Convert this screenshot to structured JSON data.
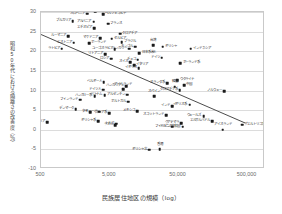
{
  "chart_data": {
    "type": "scatter",
    "title": "",
    "xlabel": "民族居住地区の規模（log）",
    "ylabel": "昭和50年代における隔離さの改善度（％）",
    "xscale": "log",
    "xlim": [
      500,
      900000
    ],
    "ylim": [
      -10,
      30
    ],
    "xticks": [
      500,
      5000,
      50000,
      500000
    ],
    "xticklabels": [
      "500",
      "5,000",
      "50,000",
      "500,000"
    ],
    "yticks": [
      -10,
      -5,
      0,
      5,
      10,
      15,
      20,
      25,
      30
    ],
    "yticklabels": [
      "-10",
      "-5",
      "0",
      "5",
      "10",
      "15",
      "20",
      "25",
      "30"
    ],
    "grid": "horizontal",
    "legend": "none",
    "trendline": {
      "label": "回帰直線",
      "x0": 500,
      "y0": 24.2,
      "x1": 500000,
      "y1": 1.3,
      "color": "#4a4a4a"
    },
    "points": [
      {
        "label": "スロベニア",
        "x": 2350,
        "y": 29.6,
        "pos": "left"
      },
      {
        "label": "ボスニア",
        "x": 3050,
        "y": 30.2,
        "pos": "right"
      },
      {
        "label": "ヘルツェゴビナ",
        "x": 4000,
        "y": 29.4,
        "pos": "right"
      },
      {
        "label": "ブルガリア",
        "x": 1450,
        "y": 27.6,
        "pos": "left"
      },
      {
        "label": "アルバニア",
        "x": 2900,
        "y": 27.5,
        "pos": "left"
      },
      {
        "label": "フランス",
        "x": 4750,
        "y": 27.0,
        "pos": "right"
      },
      {
        "label": "エチオピア",
        "x": 2950,
        "y": 25.9,
        "pos": "left"
      },
      {
        "label": "クロアチア",
        "x": 7100,
        "y": 24.5,
        "pos": "right"
      },
      {
        "label": "ルーマニア",
        "x": 1250,
        "y": 23.9,
        "pos": "left"
      },
      {
        "label": "マケドニア",
        "x": 3600,
        "y": 23.3,
        "pos": "left"
      },
      {
        "label": "セルビア",
        "x": 5350,
        "y": 23.2,
        "pos": "right"
      },
      {
        "label": "エストニア",
        "x": 1500,
        "y": 22.2,
        "pos": "left"
      },
      {
        "label": "ポーランド",
        "x": 2500,
        "y": 22.0,
        "pos": "right"
      },
      {
        "label": "ブラジル",
        "x": 7400,
        "y": 22.3,
        "pos": "right"
      },
      {
        "label": "モンゴル",
        "x": 11800,
        "y": 21.2,
        "pos": "left"
      },
      {
        "label": "台湾",
        "x": 21500,
        "y": 21.6,
        "pos": "center"
      },
      {
        "label": "ギリシャ",
        "x": 29500,
        "y": 21.2,
        "pos": "right"
      },
      {
        "label": "ラトビア",
        "x": 1000,
        "y": 20.6,
        "pos": "left"
      },
      {
        "label": "ユーゴスラビア",
        "x": 5900,
        "y": 20.5,
        "pos": "left"
      },
      {
        "label": "ハンガリー",
        "x": 9600,
        "y": 20.7,
        "pos": "left"
      },
      {
        "label": "インドネシア",
        "x": 75000,
        "y": 20.7,
        "pos": "right"
      },
      {
        "label": "リトアニア",
        "x": 4300,
        "y": 19.2,
        "pos": "left"
      },
      {
        "label": "日本系米人",
        "x": 13500,
        "y": 19.5,
        "pos": "right"
      },
      {
        "label": "ロシア",
        "x": 5200,
        "y": 18.1,
        "pos": "left"
      },
      {
        "label": "ドイツ",
        "x": 28500,
        "y": 18.4,
        "pos": "left"
      },
      {
        "label": "チェコ",
        "x": 12800,
        "y": 17.8,
        "pos": "left"
      },
      {
        "label": "スイス",
        "x": 9800,
        "y": 17.2,
        "pos": "left"
      },
      {
        "label": "ポーランド系",
        "x": 53000,
        "y": 16.9,
        "pos": "right"
      },
      {
        "label": "イタリア",
        "x": 11200,
        "y": 16.5,
        "pos": "right"
      },
      {
        "label": "イギリス",
        "x": 13200,
        "y": 15.7,
        "pos": "left"
      },
      {
        "label": "ウクライナ",
        "x": 48000,
        "y": 12.6,
        "pos": "right"
      },
      {
        "label": "ベルギー人",
        "x": 4100,
        "y": 12.1,
        "pos": "left"
      },
      {
        "label": "オランダ系",
        "x": 34000,
        "y": 11.9,
        "pos": "left"
      },
      {
        "label": "ハンガリアン",
        "x": 8700,
        "y": 11.1,
        "pos": "left"
      },
      {
        "label": "中国",
        "x": 60000,
        "y": 11.3,
        "pos": "right"
      },
      {
        "label": "韓国",
        "x": 44000,
        "y": 11.0,
        "pos": "center"
      },
      {
        "label": "ドイツ人",
        "x": 4000,
        "y": 10.2,
        "pos": "left"
      },
      {
        "label": "アイルランド",
        "x": 7800,
        "y": 10.4,
        "pos": "center"
      },
      {
        "label": "クロアチア系",
        "x": 52000,
        "y": 10.1,
        "pos": "left"
      },
      {
        "label": "ノルウェー",
        "x": 230000,
        "y": 9.8,
        "pos": "left"
      },
      {
        "label": "アルゼンチン",
        "x": 9000,
        "y": 8.9,
        "pos": "left"
      },
      {
        "label": "ベトナム",
        "x": 4200,
        "y": 8.8,
        "pos": "left"
      },
      {
        "label": "ハンガリー系",
        "x": 3000,
        "y": 8.5,
        "pos": "left"
      },
      {
        "label": "スペイン",
        "x": 22000,
        "y": 8.5,
        "pos": "center"
      },
      {
        "label": "フィンランド",
        "x": 1850,
        "y": 7.7,
        "pos": "left"
      },
      {
        "label": "ポルトガル",
        "x": 9200,
        "y": 7.1,
        "pos": "left"
      },
      {
        "label": "インド",
        "x": 40000,
        "y": 6.0,
        "pos": "left"
      },
      {
        "label": "イギリス系",
        "x": 72000,
        "y": 6.4,
        "pos": "left"
      },
      {
        "label": "デンマーク",
        "x": 1600,
        "y": 5.3,
        "pos": "left"
      },
      {
        "label": "メキシコ",
        "x": 12500,
        "y": 4.7,
        "pos": "left"
      },
      {
        "label": "キューバ",
        "x": 3500,
        "y": 4.6,
        "pos": "left"
      },
      {
        "label": "スコットランド",
        "x": 33000,
        "y": 3.7,
        "pos": "left"
      },
      {
        "label": "タイ",
        "x": 2600,
        "y": 4.5,
        "pos": "left"
      },
      {
        "label": "ロシア系",
        "x": 4900,
        "y": 4.2,
        "pos": "left"
      },
      {
        "label": "ウェールズ",
        "x": 115000,
        "y": 3.4,
        "pos": "left"
      },
      {
        "label": "ギリシャ系",
        "x": 3400,
        "y": 2.2,
        "pos": "left"
      },
      {
        "label": "トルコ",
        "x": 6200,
        "y": 1.5,
        "pos": "left"
      },
      {
        "label": "シリア",
        "x": 620,
        "y": 1.9,
        "pos": "left"
      },
      {
        "label": "グアテマラ",
        "x": 55000,
        "y": 1.7,
        "pos": "left"
      },
      {
        "label": "エルサルバドル",
        "x": 155000,
        "y": 2.2,
        "pos": "left"
      },
      {
        "label": "ラオス",
        "x": 6000,
        "y": 1.1,
        "pos": "left"
      },
      {
        "label": "ドミニカ共和国",
        "x": 57000,
        "y": 0.8,
        "pos": "left"
      },
      {
        "label": "フィリピン",
        "x": 40000,
        "y": 0.8,
        "pos": "left"
      },
      {
        "label": "アイスランド",
        "x": 220000,
        "y": 0.0,
        "pos": "center"
      },
      {
        "label": "プエルトリコ系",
        "x": 420000,
        "y": 1.3,
        "pos": "right"
      },
      {
        "label": "ギリシャ北",
        "x": 18500,
        "y": -5.1,
        "pos": "left"
      },
      {
        "label": "香港",
        "x": 26500,
        "y": -4.9,
        "pos": "center"
      }
    ]
  }
}
